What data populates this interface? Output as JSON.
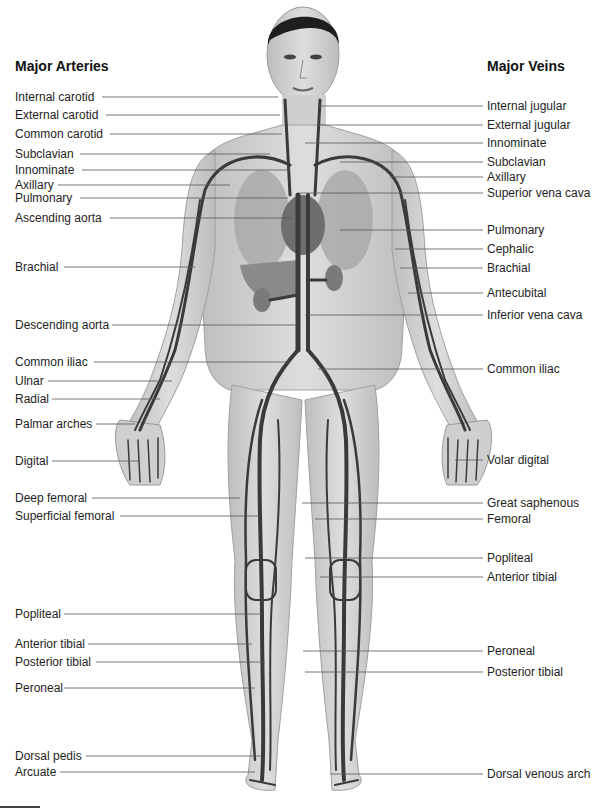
{
  "headings": {
    "arteries": "Major Arteries",
    "veins": "Major Veins"
  },
  "colors": {
    "skin": "#d6d6d6",
    "skin_shadow": "#b9b9b9",
    "vessel": "#3a3a3a",
    "hair": "#1e1e1e",
    "organ": "#8f8f8f",
    "leader_line": "#555555"
  },
  "arteries": [
    {
      "label": "Internal carotid",
      "y": 97,
      "x2": 278
    },
    {
      "label": "External carotid",
      "y": 115,
      "x2": 280
    },
    {
      "label": "Common carotid",
      "y": 134,
      "x2": 282
    },
    {
      "label": "Subclavian",
      "y": 154,
      "x2": 270
    },
    {
      "label": "Innominate",
      "y": 170,
      "x2": 290
    },
    {
      "label": "Axillary",
      "y": 185,
      "x2": 230
    },
    {
      "label": "Pulmonary",
      "y": 198,
      "x2": 288
    },
    {
      "label": "Ascending aorta",
      "y": 218,
      "x2": 292
    },
    {
      "label": "Brachial",
      "y": 267,
      "x2": 195
    },
    {
      "label": "Descending aorta",
      "y": 325,
      "x2": 298
    },
    {
      "label": "Common iliac",
      "y": 362,
      "x2": 290
    },
    {
      "label": "Ulnar",
      "y": 381,
      "x2": 172
    },
    {
      "label": "Radial",
      "y": 399,
      "x2": 160
    },
    {
      "label": "Palmar arches",
      "y": 424,
      "x2": 135
    },
    {
      "label": "Digital",
      "y": 461,
      "x2": 138
    },
    {
      "label": "Deep femoral",
      "y": 498,
      "x2": 240
    },
    {
      "label": "Superficial femoral",
      "y": 516,
      "x2": 260
    },
    {
      "label": "Popliteal",
      "y": 614,
      "x2": 262
    },
    {
      "label": "Anterior tibial",
      "y": 644,
      "x2": 252
    },
    {
      "label": "Posterior tibial",
      "y": 662,
      "x2": 265
    },
    {
      "label": "Peroneal",
      "y": 688,
      "x2": 255
    },
    {
      "label": "Dorsal pedis",
      "y": 756,
      "x2": 262
    },
    {
      "label": "Arcuate",
      "y": 772,
      "x2": 255
    }
  ],
  "veins": [
    {
      "label": "Internal jugular",
      "y": 106,
      "x1": 318
    },
    {
      "label": "External jugular",
      "y": 125,
      "x1": 318
    },
    {
      "label": "Innominate",
      "y": 143,
      "x1": 305
    },
    {
      "label": "Subclavian",
      "y": 162,
      "x1": 340
    },
    {
      "label": "Axillary",
      "y": 177,
      "x1": 390
    },
    {
      "label": "Superior vena cava",
      "y": 193,
      "x1": 300
    },
    {
      "label": "Pulmonary",
      "y": 230,
      "x1": 340
    },
    {
      "label": "Cephalic",
      "y": 249,
      "x1": 395
    },
    {
      "label": "Brachial",
      "y": 268,
      "x1": 400
    },
    {
      "label": "Antecubital",
      "y": 293,
      "x1": 408
    },
    {
      "label": "Inferior vena cava",
      "y": 315,
      "x1": 305
    },
    {
      "label": "Common iliac",
      "y": 369,
      "x1": 318
    },
    {
      "label": "Volar digital",
      "y": 460,
      "x1": 455
    },
    {
      "label": "Great saphenous",
      "y": 503,
      "x1": 302
    },
    {
      "label": "Femoral",
      "y": 519,
      "x1": 315
    },
    {
      "label": "Popliteal",
      "y": 558,
      "x1": 305
    },
    {
      "label": "Anterior tibial",
      "y": 577,
      "x1": 320
    },
    {
      "label": "Peroneal",
      "y": 651,
      "x1": 303
    },
    {
      "label": "Posterior tibial",
      "y": 672,
      "x1": 305
    },
    {
      "label": "Dorsal venous arch",
      "y": 774,
      "x1": 330
    }
  ]
}
